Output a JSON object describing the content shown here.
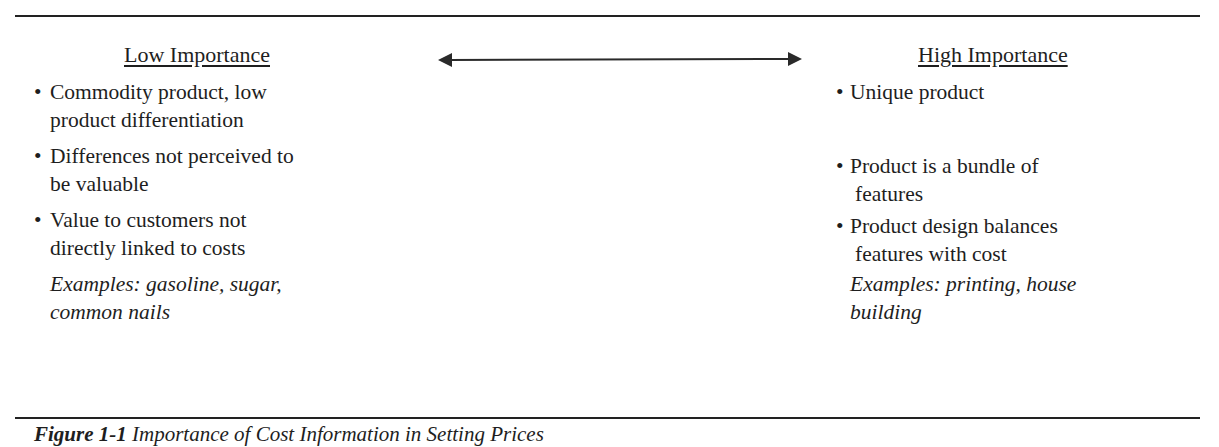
{
  "figure": {
    "left": {
      "heading": "Low Importance",
      "items": [
        {
          "line1": "Commodity product, low",
          "line2": "product differentiation"
        },
        {
          "line1": "Differences not perceived to",
          "line2": "be valuable"
        },
        {
          "line1": "Value to customers not",
          "line2": "directly linked to costs"
        }
      ],
      "examples": {
        "line1": "Examples: gasoline, sugar,",
        "line2": "common nails"
      }
    },
    "right": {
      "heading": "High Importance",
      "items": [
        {
          "line1": "Unique product",
          "line2": ""
        },
        {
          "line1": "Product is a bundle of",
          "line2": "features"
        },
        {
          "line1": "Product design balances",
          "line2": "features with cost"
        }
      ],
      "examples": {
        "line1": "Examples: printing, house",
        "line2": "building"
      }
    },
    "arrow": {
      "icon": "double-headed-arrow-icon"
    },
    "bullet_glyph": "•",
    "caption": {
      "label": "Figure 1-1",
      "text": "Importance of Cost Information in Setting Prices"
    }
  }
}
